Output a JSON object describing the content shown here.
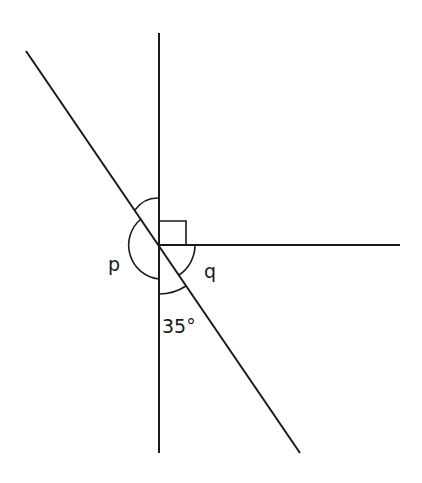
{
  "diagram": {
    "labels": {
      "p": "p",
      "q": "q",
      "angle_35": "35°"
    },
    "colors": {
      "stroke": "#1a1a1a",
      "background": "#ffffff"
    },
    "elements": {
      "vertical_line": "vertical line",
      "diagonal_line": "diagonal line",
      "horizontal_ray": "horizontal ray",
      "right_angle_marker": "right angle marker",
      "angle_p_arc": "angle p arc",
      "angle_q_arc": "angle q arc",
      "angle_35_arc": "angle 35 arc"
    }
  }
}
